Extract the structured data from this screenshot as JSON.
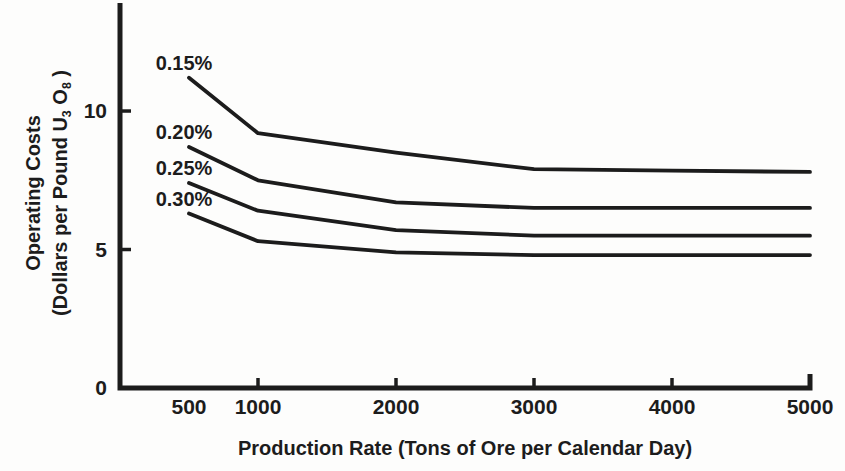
{
  "figure": {
    "background_color": "#fdfdfc",
    "ink_color": "#1c1c1c"
  },
  "chart_data": {
    "type": "line",
    "title": "",
    "xlabel": "Production Rate (Tons of Ore per Calendar Day)",
    "ylabel_line1": "Operating Costs",
    "ylabel_line2": "(Dollars per Pound U3O8)",
    "ylabel_line2_parts": {
      "pre": "(Dollars per Pound U",
      "sub1": "3",
      "mid": " O",
      "sub2": "8",
      "post": " )"
    },
    "x": [
      500,
      1000,
      2000,
      3000,
      4000,
      5000
    ],
    "xlim": [
      0,
      5000
    ],
    "ylim": [
      0,
      13.9
    ],
    "grid": false,
    "x_tick_values": [
      1000,
      2000,
      3000,
      4000
    ],
    "x_axis_end_tick_value": 5000,
    "x_labels": [
      {
        "value": 500,
        "label": "500"
      },
      {
        "value": 1000,
        "label": "1000"
      },
      {
        "value": 2000,
        "label": "2000"
      },
      {
        "value": 3000,
        "label": "3000"
      },
      {
        "value": 4000,
        "label": "4000"
      },
      {
        "value": 5000,
        "label": "5000"
      }
    ],
    "y_ticks": [
      {
        "value": 0,
        "label": "0"
      },
      {
        "value": 5,
        "label": "5"
      },
      {
        "value": 10,
        "label": "10"
      }
    ],
    "series": [
      {
        "name": "0.15%",
        "values": [
          11.2,
          9.2,
          8.5,
          7.9,
          7.85,
          7.8
        ]
      },
      {
        "name": "0.20%",
        "values": [
          8.7,
          7.5,
          6.7,
          6.5,
          6.5,
          6.5
        ]
      },
      {
        "name": "0.25%",
        "values": [
          7.4,
          6.4,
          5.7,
          5.5,
          5.5,
          5.5
        ]
      },
      {
        "name": "0.30%",
        "values": [
          6.3,
          5.3,
          4.9,
          4.8,
          4.8,
          4.8
        ]
      }
    ],
    "legend": "inline-labels-at-curve-start",
    "line_color": "#1c1c1c",
    "ink_color": "#1c1c1c"
  }
}
